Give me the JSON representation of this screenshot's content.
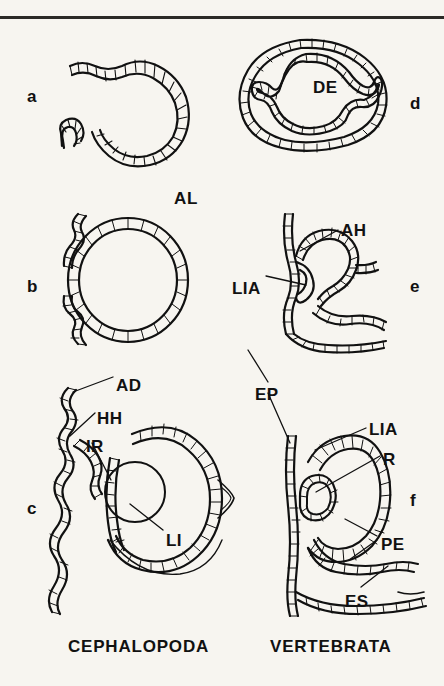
{
  "figure": {
    "title_visible": false,
    "background_color": "#f7f5f0",
    "ink_color": "#111111",
    "rule_color": "#2b2a26"
  },
  "group_titles": [
    {
      "id": "cephalopoda",
      "text": "CEPHALOPODA",
      "x": 68,
      "y": 638
    },
    {
      "id": "vertebrata",
      "text": "VERTEBRATA",
      "x": 270,
      "y": 638
    }
  ],
  "panel_letters": [
    {
      "id": "a",
      "text": "a",
      "x": 27,
      "y": 88
    },
    {
      "id": "b",
      "text": "b",
      "x": 27,
      "y": 278
    },
    {
      "id": "c",
      "text": "c",
      "x": 27,
      "y": 500
    },
    {
      "id": "d",
      "text": "d",
      "x": 410,
      "y": 95
    },
    {
      "id": "e",
      "text": "e",
      "x": 410,
      "y": 278
    },
    {
      "id": "f",
      "text": "f",
      "x": 410,
      "y": 492
    }
  ],
  "part_labels": [
    {
      "id": "AL",
      "text": "AL",
      "x": 174,
      "y": 190,
      "panel": "a"
    },
    {
      "id": "DE",
      "text": "DE",
      "x": 313,
      "y": 79,
      "panel": "d"
    },
    {
      "id": "AH",
      "text": "AH",
      "x": 341,
      "y": 222,
      "panel": "e"
    },
    {
      "id": "LIA_e",
      "text": "LIA",
      "x": 232,
      "y": 280,
      "panel": "e"
    },
    {
      "id": "AD",
      "text": "AD",
      "x": 116,
      "y": 377,
      "panel": "c"
    },
    {
      "id": "HH",
      "text": "HH",
      "x": 97,
      "y": 410,
      "panel": "c"
    },
    {
      "id": "IR",
      "text": "IR",
      "x": 86,
      "y": 438,
      "panel": "c"
    },
    {
      "id": "LI",
      "text": "LI",
      "x": 166,
      "y": 532,
      "panel": "c"
    },
    {
      "id": "EP",
      "text": "EP",
      "x": 255,
      "y": 386,
      "panel": "f"
    },
    {
      "id": "LIA_f",
      "text": "LIA",
      "x": 369,
      "y": 421,
      "panel": "f"
    },
    {
      "id": "R",
      "text": "R",
      "x": 383,
      "y": 451,
      "panel": "f"
    },
    {
      "id": "PE",
      "text": "PE",
      "x": 381,
      "y": 536,
      "panel": "f"
    },
    {
      "id": "ES",
      "text": "ES",
      "x": 345,
      "y": 593,
      "panel": "f"
    }
  ],
  "leader_lines": [
    {
      "for": "AL",
      "points": []
    },
    {
      "for": "AH",
      "points": [
        [
          338,
          230
        ],
        [
          300,
          250
        ]
      ]
    },
    {
      "for": "LIA_e",
      "points": [
        [
          266,
          276
        ],
        [
          305,
          285
        ]
      ]
    },
    {
      "for": "AD",
      "points": [
        [
          113,
          377
        ],
        [
          71,
          392
        ]
      ]
    },
    {
      "for": "HH",
      "points": [
        [
          95,
          413
        ],
        [
          70,
          433
        ]
      ]
    },
    {
      "for": "IR",
      "points": [
        [
          92,
          443
        ],
        [
          110,
          478
        ]
      ]
    },
    {
      "for": "LI",
      "points": [
        [
          163,
          530
        ],
        [
          129,
          505
        ]
      ]
    },
    {
      "for": "EP",
      "points": [
        [
          268,
          383
        ],
        [
          288,
          440
        ]
      ]
    },
    {
      "for": "LIA_f",
      "points": [
        [
          366,
          428
        ],
        [
          300,
          462
        ]
      ]
    },
    {
      "for": "R",
      "points": [
        [
          380,
          456
        ],
        [
          352,
          470
        ]
      ]
    },
    {
      "for": "PE",
      "points": [
        [
          377,
          538
        ],
        [
          344,
          520
        ]
      ]
    },
    {
      "for": "PE2",
      "points": [
        [
          377,
          540
        ],
        [
          348,
          556
        ]
      ]
    },
    {
      "for": "ES",
      "points": [
        [
          360,
          588
        ],
        [
          385,
          568
        ]
      ]
    }
  ],
  "panels": [
    {
      "id": "a",
      "stage": 1,
      "lineage": "cephalopoda",
      "caption": "open epithelial invagination forming optic cup"
    },
    {
      "id": "b",
      "stage": 2,
      "lineage": "cephalopoda",
      "caption": "closed vesicle with adjacent surface epithelium"
    },
    {
      "id": "c",
      "stage": 3,
      "lineage": "cephalopoda",
      "caption": "mature cephalopod eye: everse retina, lens, iris, cornea"
    },
    {
      "id": "d",
      "stage": 1,
      "lineage": "vertebrata",
      "caption": "neural tube with diencephalon evagination"
    },
    {
      "id": "e",
      "stage": 2,
      "lineage": "vertebrata",
      "caption": "optic vesicle contacting lens placode"
    },
    {
      "id": "f",
      "stage": 3,
      "lineage": "vertebrata",
      "caption": "optic cup: inverse retina, pigment epithelium, lens, eye stalk"
    }
  ],
  "legend_keys": [
    {
      "abbr": "AL",
      "meaning": "Anlage / optic anlage"
    },
    {
      "abbr": "DE",
      "meaning": "Diencephalon"
    },
    {
      "abbr": "AH",
      "meaning": "Augenblase (optic vesicle)"
    },
    {
      "abbr": "LIA",
      "meaning": "Linsenanlage (lens anlage)"
    },
    {
      "abbr": "AD",
      "meaning": "Aussere Dermis (outer dermis)"
    },
    {
      "abbr": "HH",
      "meaning": "Hornhaut (cornea)"
    },
    {
      "abbr": "IR",
      "meaning": "Iris"
    },
    {
      "abbr": "LI",
      "meaning": "Linse (lens)"
    },
    {
      "abbr": "EP",
      "meaning": "Epidermis"
    },
    {
      "abbr": "R",
      "meaning": "Retina"
    },
    {
      "abbr": "PE",
      "meaning": "Pigmentepithel (pigment epithelium)"
    },
    {
      "abbr": "ES",
      "meaning": "Augenstiel (eye stalk)"
    }
  ]
}
